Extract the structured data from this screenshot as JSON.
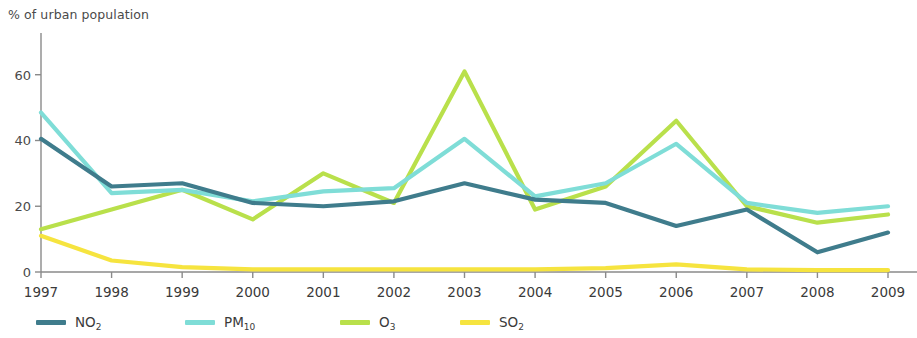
{
  "chart_data": {
    "type": "line",
    "title": "% of urban population",
    "xlabel": "",
    "ylabel": "% of urban population",
    "ylim": [
      0,
      66
    ],
    "yticks": [
      0,
      20,
      40,
      60
    ],
    "grid": false,
    "legend_position": "bottom",
    "categories": [
      "1997",
      "1998",
      "1999",
      "2000",
      "2001",
      "2002",
      "2003",
      "2004",
      "2005",
      "2006",
      "2007",
      "2008",
      "2009"
    ],
    "series": [
      {
        "name": "NO2",
        "label": "NO",
        "sub": "2",
        "color": "#3f7c8c",
        "values": [
          40.5,
          26,
          27,
          21,
          20,
          21.5,
          27,
          22,
          21,
          14,
          19,
          6,
          12
        ]
      },
      {
        "name": "PM10",
        "label": "PM",
        "sub": "10",
        "color": "#7fddd7",
        "values": [
          48.5,
          24,
          25,
          21.5,
          24.5,
          25.5,
          40.5,
          23,
          27,
          39,
          21,
          18,
          20
        ]
      },
      {
        "name": "O3",
        "label": "O",
        "sub": "3",
        "color": "#b9e04b",
        "values": [
          13,
          19,
          25,
          16,
          30,
          21,
          61,
          19,
          26,
          46,
          20,
          15,
          17.5
        ]
      },
      {
        "name": "SO2",
        "label": "SO",
        "sub": "2",
        "color": "#f6e43f",
        "values": [
          11,
          3.5,
          1.5,
          0.8,
          0.8,
          0.8,
          0.8,
          0.8,
          1.2,
          2.3,
          0.8,
          0.6,
          0.6
        ]
      }
    ]
  },
  "axes": {
    "y_tick_labels": [
      "0",
      "20",
      "40",
      "60"
    ],
    "x_tick_labels": [
      "1997",
      "1998",
      "1999",
      "2000",
      "2001",
      "2002",
      "2003",
      "2004",
      "2005",
      "2006",
      "2007",
      "2008",
      "2009"
    ]
  },
  "legend": {
    "items": [
      {
        "label": "NO",
        "sub": "2",
        "color": "#3f7c8c"
      },
      {
        "label": "PM",
        "sub": "10",
        "color": "#7fddd7"
      },
      {
        "label": "O",
        "sub": "3",
        "color": "#b9e04b"
      },
      {
        "label": "SO",
        "sub": "2",
        "color": "#f6e43f"
      }
    ]
  }
}
